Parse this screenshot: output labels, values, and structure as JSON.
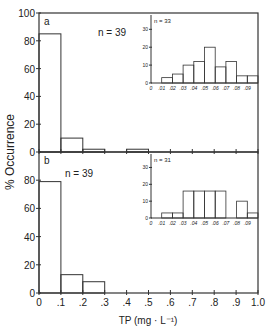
{
  "chart_data": {
    "type": "bar",
    "ylabel": "% Occurrence",
    "xlabel": "TP (mg · L⁻¹)",
    "x_ticks": [
      "0",
      ".1",
      ".2",
      ".3",
      ".4",
      ".5",
      ".6",
      ".7",
      ".8",
      ".9",
      "1.0"
    ],
    "y_ticks": [
      "0",
      "20",
      "40",
      "60",
      "80",
      "100"
    ],
    "panels": [
      {
        "label": "a",
        "n_label": "n = 39",
        "bin_edges": [
          0,
          0.1,
          0.2,
          0.3,
          0.4,
          0.5,
          0.6,
          0.7,
          0.8,
          0.9,
          1.0
        ],
        "values": [
          85,
          10,
          2,
          0,
          2,
          0,
          0,
          0,
          0,
          0
        ],
        "ylim": [
          0,
          100
        ],
        "inset": {
          "n_label": "n = 33",
          "x_ticks": [
            "0",
            ".01",
            ".02",
            ".03",
            ".04",
            ".05",
            ".06",
            ".07",
            ".08",
            ".09"
          ],
          "y_ticks": [
            "0",
            "10",
            "20",
            "30"
          ],
          "values": [
            0,
            3,
            5,
            10,
            12,
            20,
            9,
            12,
            4,
            4
          ],
          "ylim": [
            0,
            38
          ]
        }
      },
      {
        "label": "b",
        "n_label": "n = 39",
        "bin_edges": [
          0,
          0.1,
          0.2,
          0.3,
          0.4,
          0.5,
          0.6,
          0.7,
          0.8,
          0.9,
          1.0
        ],
        "values": [
          79,
          13,
          8,
          0,
          0,
          0,
          0,
          0,
          0,
          0
        ],
        "ylim": [
          0,
          100
        ],
        "inset": {
          "n_label": "n = 31",
          "x_ticks": [
            "0",
            ".01",
            ".02",
            ".03",
            ".04",
            ".05",
            ".06",
            ".07",
            ".08",
            ".09"
          ],
          "y_ticks": [
            "0",
            "10",
            "20",
            "30"
          ],
          "values": [
            0,
            3,
            3,
            16,
            16,
            16,
            16,
            0,
            10,
            3
          ],
          "ylim": [
            0,
            38
          ]
        }
      }
    ]
  }
}
